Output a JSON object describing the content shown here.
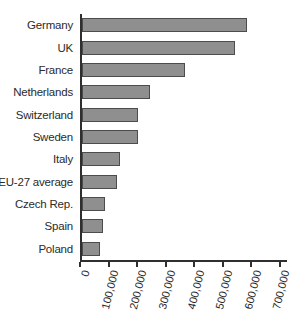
{
  "figure": {
    "background": "#ffffff"
  },
  "chart_data": {
    "type": "bar",
    "orientation": "horizontal",
    "title": "",
    "xlabel": "",
    "ylabel": "",
    "categories": [
      "Germany",
      "UK",
      "France",
      "Netherlands",
      "Switzerland",
      "Sweden",
      "Italy",
      "EU-27 average",
      "Czech Rep.",
      "Spain",
      "Poland"
    ],
    "values": [
      570000,
      530000,
      355000,
      230000,
      190000,
      190000,
      125000,
      115000,
      75000,
      65000,
      55000
    ],
    "xlim": [
      0,
      700000
    ],
    "x_ticks": [
      0,
      100000,
      200000,
      300000,
      400000,
      500000,
      600000,
      700000
    ],
    "x_tick_labels": [
      "0",
      "100,000",
      "200,000",
      "300,000",
      "400,000",
      "500,000",
      "600,000",
      "700,000"
    ],
    "x_tick_label_rotation_deg": -76,
    "grid": false,
    "legend": "none",
    "bar_color": "#8f8f8f",
    "bar_border_color": "#4c4c4c",
    "axis_color": "#2f2f2f",
    "label_color": "#2b2b2b"
  }
}
